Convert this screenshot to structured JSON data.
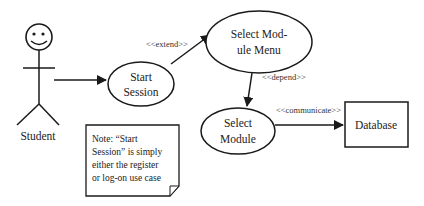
{
  "actor": {
    "name": "Student"
  },
  "use_cases": [
    {
      "id": "start-session",
      "lines": [
        "Start",
        "Session"
      ]
    },
    {
      "id": "select-module-menu",
      "lines": [
        "Select Mod-",
        "ule Menu"
      ]
    },
    {
      "id": "select-module",
      "lines": [
        "Select",
        "Module"
      ]
    }
  ],
  "external": {
    "database": "Database"
  },
  "relations": {
    "extend": "<<extend>>",
    "depend": "<<depend>>",
    "communicate": "<<communicate>>"
  },
  "note": {
    "lines": [
      "Note: “Start",
      "Session” is simply",
      "either the register",
      "or log-on use case"
    ]
  },
  "colors": {
    "stroke": "#1a1a1a",
    "background": "#ffffff"
  }
}
